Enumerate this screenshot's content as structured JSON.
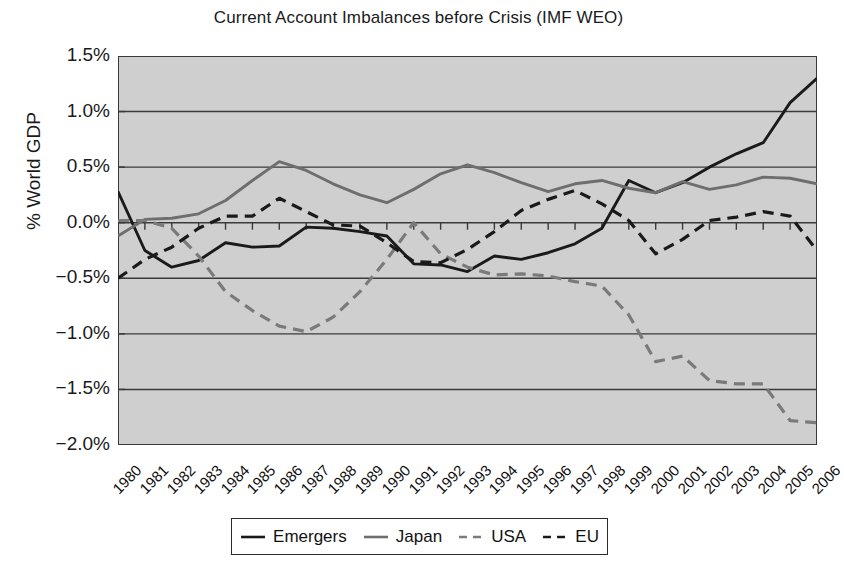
{
  "chart_data": {
    "type": "line",
    "title": "Current Account Imbalances before Crisis (IMF WEO)",
    "xlabel": "",
    "ylabel": "% World GDP",
    "ylim": [
      -2.0,
      1.5
    ],
    "ytick_labels": [
      "1.5%",
      "1.0%",
      "0.5%",
      "0.0%",
      "−0.5%",
      "−1.0%",
      "−1.5%",
      "−2.0%"
    ],
    "ytick_values": [
      1.5,
      1.0,
      0.5,
      0.0,
      -0.5,
      -1.0,
      -1.5,
      -2.0
    ],
    "grid": true,
    "legend_position": "bottom",
    "plot_background": "#cfcfcf",
    "categories": [
      "1980",
      "1981",
      "1982",
      "1983",
      "1984",
      "1985",
      "1986",
      "1987",
      "1988",
      "1989",
      "1990",
      "1991",
      "1992",
      "1993",
      "1994",
      "1995",
      "1996",
      "1997",
      "1998",
      "1999",
      "2000",
      "2001",
      "2002",
      "2003",
      "2004",
      "2005",
      "2006"
    ],
    "series": [
      {
        "name": "Emergers",
        "color": "#1a1a1a",
        "style": "solid",
        "values": [
          0.28,
          -0.25,
          -0.4,
          -0.34,
          -0.18,
          -0.22,
          -0.21,
          -0.04,
          -0.05,
          -0.08,
          -0.12,
          -0.37,
          -0.38,
          -0.44,
          -0.3,
          -0.33,
          -0.27,
          -0.19,
          -0.05,
          0.38,
          0.27,
          0.36,
          0.5,
          0.62,
          0.72,
          1.08,
          1.3
        ]
      },
      {
        "name": "Japan",
        "color": "#6e6e6e",
        "style": "solid",
        "values": [
          -0.12,
          0.03,
          0.04,
          0.08,
          0.2,
          0.38,
          0.55,
          0.47,
          0.35,
          0.25,
          0.18,
          0.3,
          0.44,
          0.52,
          0.45,
          0.36,
          0.28,
          0.35,
          0.38,
          0.31,
          0.27,
          0.37,
          0.3,
          0.34,
          0.41,
          0.4,
          0.35
        ]
      },
      {
        "name": "USA",
        "color": "#7a7a7a",
        "style": "dashed",
        "values": [
          0.02,
          0.02,
          -0.05,
          -0.3,
          -0.62,
          -0.79,
          -0.93,
          -0.98,
          -0.85,
          -0.62,
          -0.33,
          0.0,
          -0.28,
          -0.4,
          -0.47,
          -0.46,
          -0.48,
          -0.53,
          -0.57,
          -0.83,
          -1.25,
          -1.2,
          -1.42,
          -1.45,
          -1.45,
          -1.78,
          -1.8
        ]
      },
      {
        "name": "EU",
        "color": "#1a1a1a",
        "style": "dashed",
        "values": [
          -0.5,
          -0.33,
          -0.22,
          -0.05,
          0.06,
          0.06,
          0.22,
          0.1,
          -0.02,
          -0.03,
          -0.18,
          -0.35,
          -0.36,
          -0.24,
          -0.08,
          0.11,
          0.21,
          0.29,
          0.17,
          0.02,
          -0.28,
          -0.15,
          0.02,
          0.05,
          0.1,
          0.06,
          -0.25
        ]
      }
    ]
  },
  "legend": {
    "items": [
      {
        "label": "Emergers"
      },
      {
        "label": "Japan"
      },
      {
        "label": "USA"
      },
      {
        "label": "EU"
      }
    ]
  }
}
